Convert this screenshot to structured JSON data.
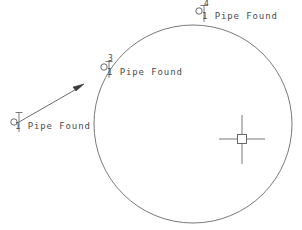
{
  "drawing": {
    "title": "Survey Plat Detail",
    "background_color": "#ffffff",
    "line_color": "#5a5a5a",
    "text_color": "#4a4a4a",
    "width": 302,
    "height": 230
  },
  "boundary_circle": {
    "name": "property-boundary-arc",
    "center_x": 193,
    "center_y": 124,
    "radius": 99,
    "stroke_width": 0.9
  },
  "center_monument": {
    "name": "center-point-monument",
    "x": 242,
    "y": 139,
    "square_size": 9,
    "crosshair_length": 46,
    "crosshair_height": 50
  },
  "leader_arrow": {
    "name": "leader-arrow",
    "from_x": 19,
    "from_y": 122,
    "to_x": 83,
    "to_y": 85
  },
  "markers": [
    {
      "id": "marker-1",
      "point_number": "",
      "label": "1 Pipe Found",
      "circle_x": 14,
      "circle_y": 122,
      "circle_r": 3.2,
      "tick_x": 19,
      "tick_top": 112,
      "tick_bottom": 132,
      "label_x": 15,
      "label_y": 124
    },
    {
      "id": "marker-3",
      "point_number": "3",
      "label": "1 Pipe Found",
      "circle_x": 104,
      "circle_y": 67,
      "circle_r": 3.2,
      "tick_x": 109,
      "tick_top": 60,
      "tick_bottom": 78,
      "label_x": 105,
      "label_y": 69,
      "number_x": 108,
      "number_y": 56
    },
    {
      "id": "marker-4",
      "point_number": "4",
      "label": "1 Pipe Found",
      "circle_x": 199,
      "circle_y": 11,
      "circle_r": 3.2,
      "tick_x": 204,
      "tick_top": 4,
      "tick_bottom": 22,
      "label_x": 200,
      "label_y": 14,
      "number_x": 204,
      "number_y": 1
    }
  ]
}
